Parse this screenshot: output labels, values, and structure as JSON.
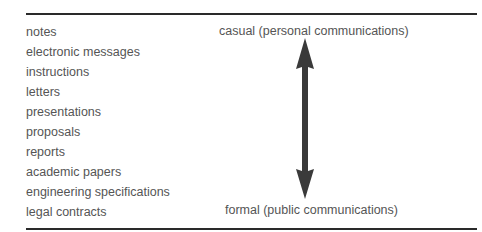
{
  "diagram": {
    "document_types": [
      "notes",
      "electronic messages",
      "instructions",
      "letters",
      "presentations",
      "proposals",
      "reports",
      "academic papers",
      "engineering specifications",
      "legal contracts"
    ],
    "scale": {
      "top_label": "casual (personal communications)",
      "bottom_label": "formal (public communications)",
      "arrow_icon": "double-headed-vertical-arrow",
      "arrow_color": "#3a3a3a"
    },
    "rule_color": "#2a2a2a",
    "text_color": "#555555"
  }
}
